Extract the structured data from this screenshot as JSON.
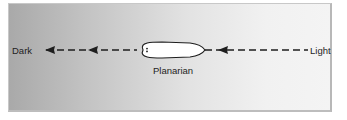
{
  "diagram": {
    "left_label": "Dark",
    "right_label": "Light",
    "organism_label": "Planarian",
    "arrow_direction": "toward-dark",
    "colors": {
      "gradient_dark": "#a9a9a9",
      "gradient_light": "#f4f4f4",
      "line": "#1e1e1e",
      "organism_fill": "#ffffff"
    }
  }
}
